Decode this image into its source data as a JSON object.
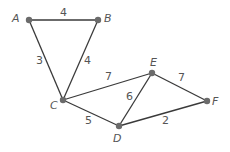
{
  "graph": {
    "nodes": [
      {
        "id": "A",
        "label": "A",
        "x": 29,
        "y": 20,
        "lx": 12,
        "ly": 22
      },
      {
        "id": "B",
        "label": "B",
        "x": 98,
        "y": 20,
        "lx": 104,
        "ly": 22
      },
      {
        "id": "C",
        "label": "C",
        "x": 63,
        "y": 100,
        "lx": 50,
        "ly": 109
      },
      {
        "id": "D",
        "label": "D",
        "x": 119,
        "y": 126,
        "lx": 113,
        "ly": 142
      },
      {
        "id": "E",
        "label": "E",
        "x": 152,
        "y": 73,
        "lx": 150,
        "ly": 66
      },
      {
        "id": "F",
        "label": "F",
        "x": 207,
        "y": 101,
        "lx": 212,
        "ly": 105
      }
    ],
    "edges": [
      {
        "from": "A",
        "to": "B",
        "weight": "4",
        "lx": 60,
        "ly": 16
      },
      {
        "from": "A",
        "to": "C",
        "weight": "3",
        "lx": 36,
        "ly": 64
      },
      {
        "from": "B",
        "to": "C",
        "weight": "4",
        "lx": 84,
        "ly": 64
      },
      {
        "from": "C",
        "to": "E",
        "weight": "7",
        "lx": 105,
        "ly": 80
      },
      {
        "from": "C",
        "to": "D",
        "weight": "5",
        "lx": 85,
        "ly": 124
      },
      {
        "from": "D",
        "to": "E",
        "weight": "6",
        "lx": 126,
        "ly": 100
      },
      {
        "from": "E",
        "to": "F",
        "weight": "7",
        "lx": 178,
        "ly": 81
      },
      {
        "from": "D",
        "to": "F",
        "weight": "2",
        "lx": 162,
        "ly": 124
      }
    ]
  }
}
